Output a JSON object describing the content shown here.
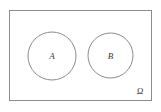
{
  "figure": {
    "type": "venn-diagram",
    "caption": "",
    "width": 161,
    "height": 112,
    "background_color": "#ffffff",
    "stroke_color": "#8c8c8c",
    "label_color": "#3a3a3a",
    "stroke_width": 1
  },
  "universe": {
    "name": "universe-set",
    "label": "Ω",
    "label_x": 140,
    "label_y": 94,
    "rect": {
      "x": 9,
      "y": 10,
      "width": 143,
      "height": 91
    }
  },
  "sets": [
    {
      "name": "set-a",
      "label": "A",
      "cx": 52,
      "cy": 56,
      "r": 24,
      "label_x": 52,
      "label_y": 59
    },
    {
      "name": "set-b",
      "label": "B",
      "cx": 110.5,
      "cy": 55.5,
      "r": 22.5,
      "label_x": 110.5,
      "label_y": 58.5
    }
  ],
  "relation": {
    "overlap": false,
    "description": "disjoint"
  }
}
